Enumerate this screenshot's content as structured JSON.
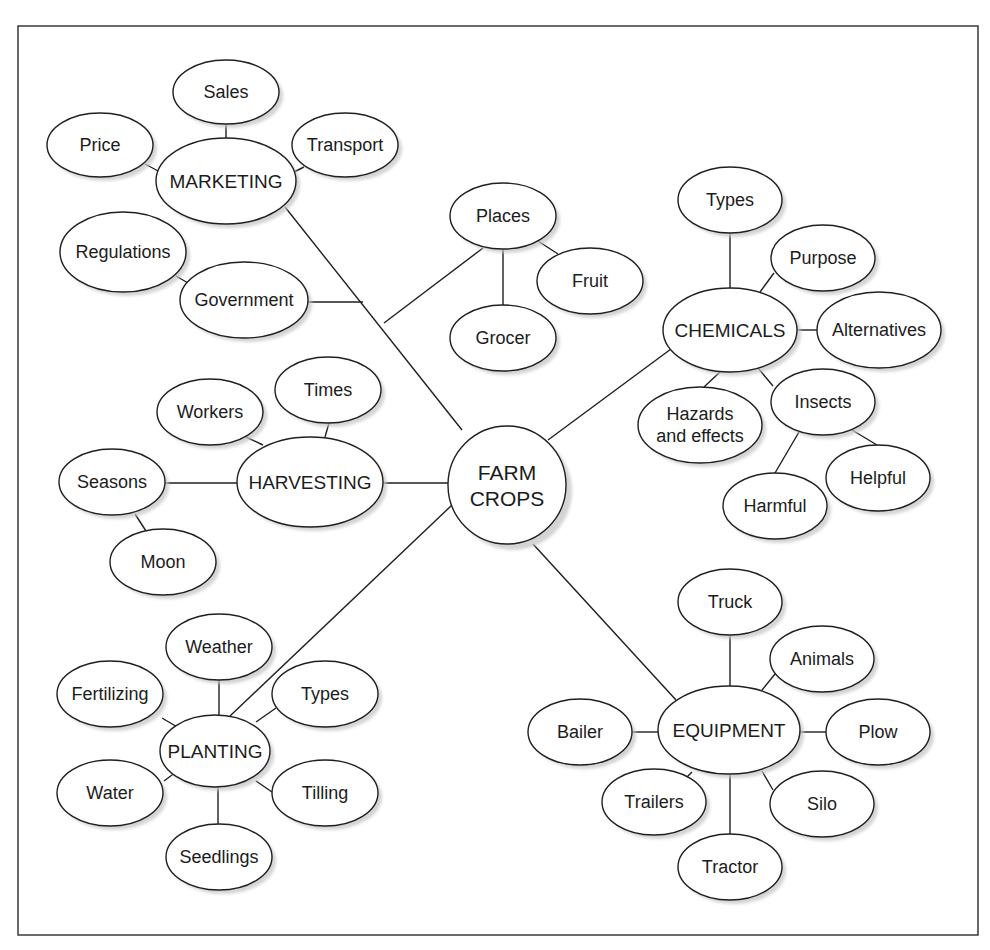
{
  "diagram": {
    "type": "concept-map",
    "root": {
      "id": "farm-crops",
      "lines": [
        "FARM",
        "CROPS"
      ],
      "cx": 507,
      "cy": 485,
      "r": 59
    },
    "frame": {
      "x": 18,
      "y": 26,
      "w": 960,
      "h": 909
    },
    "nodes": [
      {
        "id": "marketing",
        "kind": "hub",
        "lines": [
          "MARKETING"
        ],
        "cx": 226,
        "cy": 181,
        "rx": 70,
        "ry": 43
      },
      {
        "id": "sales",
        "kind": "leaf",
        "lines": [
          "Sales"
        ],
        "cx": 226,
        "cy": 92,
        "rx": 53,
        "ry": 32
      },
      {
        "id": "price",
        "kind": "leaf",
        "lines": [
          "Price"
        ],
        "cx": 100,
        "cy": 145,
        "rx": 53,
        "ry": 32
      },
      {
        "id": "transport",
        "kind": "leaf",
        "lines": [
          "Transport"
        ],
        "cx": 345,
        "cy": 145,
        "rx": 53,
        "ry": 32
      },
      {
        "id": "regulations",
        "kind": "leaf",
        "lines": [
          "Regulations"
        ],
        "cx": 123,
        "cy": 252,
        "rx": 63,
        "ry": 40
      },
      {
        "id": "government",
        "kind": "leaf",
        "lines": [
          "Government"
        ],
        "cx": 244,
        "cy": 300,
        "rx": 64,
        "ry": 38
      },
      {
        "id": "places",
        "kind": "leaf",
        "lines": [
          "Places"
        ],
        "cx": 503,
        "cy": 216,
        "rx": 53,
        "ry": 33
      },
      {
        "id": "fruit",
        "kind": "leaf",
        "lines": [
          "Fruit"
        ],
        "cx": 590,
        "cy": 281,
        "rx": 53,
        "ry": 33
      },
      {
        "id": "grocer",
        "kind": "leaf",
        "lines": [
          "Grocer"
        ],
        "cx": 503,
        "cy": 338,
        "rx": 53,
        "ry": 33
      },
      {
        "id": "chemicals",
        "kind": "hub",
        "lines": [
          "CHEMICALS"
        ],
        "cx": 730,
        "cy": 330,
        "rx": 67,
        "ry": 42
      },
      {
        "id": "chem-types",
        "kind": "leaf",
        "lines": [
          "Types"
        ],
        "cx": 730,
        "cy": 200,
        "rx": 52,
        "ry": 33
      },
      {
        "id": "purpose",
        "kind": "leaf",
        "lines": [
          "Purpose"
        ],
        "cx": 823,
        "cy": 258,
        "rx": 52,
        "ry": 33
      },
      {
        "id": "alternatives",
        "kind": "leaf",
        "lines": [
          "Alternatives"
        ],
        "cx": 879,
        "cy": 330,
        "rx": 62,
        "ry": 38
      },
      {
        "id": "hazards",
        "kind": "leaf",
        "lines": [
          "Hazards",
          "and effects"
        ],
        "cx": 700,
        "cy": 425,
        "rx": 62,
        "ry": 38
      },
      {
        "id": "insects",
        "kind": "leaf",
        "lines": [
          "Insects"
        ],
        "cx": 823,
        "cy": 402,
        "rx": 52,
        "ry": 33
      },
      {
        "id": "helpful",
        "kind": "leaf",
        "lines": [
          "Helpful"
        ],
        "cx": 878,
        "cy": 478,
        "rx": 52,
        "ry": 33
      },
      {
        "id": "harmful",
        "kind": "leaf",
        "lines": [
          "Harmful"
        ],
        "cx": 775,
        "cy": 506,
        "rx": 52,
        "ry": 33
      },
      {
        "id": "harvesting",
        "kind": "hub",
        "lines": [
          "HARVESTING"
        ],
        "cx": 310,
        "cy": 482,
        "rx": 73,
        "ry": 45
      },
      {
        "id": "workers",
        "kind": "leaf",
        "lines": [
          "Workers"
        ],
        "cx": 210,
        "cy": 412,
        "rx": 53,
        "ry": 33
      },
      {
        "id": "times",
        "kind": "leaf",
        "lines": [
          "Times"
        ],
        "cx": 328,
        "cy": 390,
        "rx": 53,
        "ry": 33
      },
      {
        "id": "seasons",
        "kind": "leaf",
        "lines": [
          "Seasons"
        ],
        "cx": 112,
        "cy": 482,
        "rx": 53,
        "ry": 33
      },
      {
        "id": "moon",
        "kind": "leaf",
        "lines": [
          "Moon"
        ],
        "cx": 163,
        "cy": 562,
        "rx": 53,
        "ry": 33
      },
      {
        "id": "planting",
        "kind": "hub",
        "lines": [
          "PLANTING"
        ],
        "cx": 215,
        "cy": 751,
        "rx": 55,
        "ry": 36
      },
      {
        "id": "weather",
        "kind": "leaf",
        "lines": [
          "Weather"
        ],
        "cx": 219,
        "cy": 647,
        "rx": 53,
        "ry": 33
      },
      {
        "id": "fertilizing",
        "kind": "leaf",
        "lines": [
          "Fertilizing"
        ],
        "cx": 110,
        "cy": 694,
        "rx": 53,
        "ry": 33
      },
      {
        "id": "plant-types",
        "kind": "leaf",
        "lines": [
          "Types"
        ],
        "cx": 325,
        "cy": 694,
        "rx": 53,
        "ry": 33
      },
      {
        "id": "water",
        "kind": "leaf",
        "lines": [
          "Water"
        ],
        "cx": 110,
        "cy": 793,
        "rx": 53,
        "ry": 33
      },
      {
        "id": "tilling",
        "kind": "leaf",
        "lines": [
          "Tilling"
        ],
        "cx": 325,
        "cy": 793,
        "rx": 53,
        "ry": 33
      },
      {
        "id": "seedlings",
        "kind": "leaf",
        "lines": [
          "Seedlings"
        ],
        "cx": 219,
        "cy": 857,
        "rx": 53,
        "ry": 33
      },
      {
        "id": "equipment",
        "kind": "hub",
        "lines": [
          "EQUIPMENT"
        ],
        "cx": 729,
        "cy": 730,
        "rx": 71,
        "ry": 44
      },
      {
        "id": "truck",
        "kind": "leaf",
        "lines": [
          "Truck"
        ],
        "cx": 730,
        "cy": 602,
        "rx": 52,
        "ry": 33
      },
      {
        "id": "animals",
        "kind": "leaf",
        "lines": [
          "Animals"
        ],
        "cx": 822,
        "cy": 659,
        "rx": 52,
        "ry": 33
      },
      {
        "id": "bailer",
        "kind": "leaf",
        "lines": [
          "Bailer"
        ],
        "cx": 580,
        "cy": 732,
        "rx": 52,
        "ry": 33
      },
      {
        "id": "plow",
        "kind": "leaf",
        "lines": [
          "Plow"
        ],
        "cx": 878,
        "cy": 732,
        "rx": 52,
        "ry": 33
      },
      {
        "id": "trailers",
        "kind": "leaf",
        "lines": [
          "Trailers"
        ],
        "cx": 654,
        "cy": 802,
        "rx": 52,
        "ry": 33
      },
      {
        "id": "silo",
        "kind": "leaf",
        "lines": [
          "Silo"
        ],
        "cx": 822,
        "cy": 804,
        "rx": 52,
        "ry": 33
      },
      {
        "id": "tractor",
        "kind": "leaf",
        "lines": [
          "Tractor"
        ],
        "cx": 730,
        "cy": 867,
        "rx": 52,
        "ry": 33
      }
    ],
    "edges": [
      {
        "from": "farm-crops",
        "to": "marketing",
        "pts": [
          [
            285,
            207
          ],
          [
            462,
            430
          ]
        ]
      },
      {
        "from": "government",
        "to": "marketing-branch",
        "pts": [
          [
            308,
            302
          ],
          [
            363,
            302
          ]
        ]
      },
      {
        "from": "places",
        "to": "marketing-branch",
        "pts": [
          [
            483,
            248
          ],
          [
            384,
            323
          ]
        ]
      },
      {
        "from": "places",
        "to": "grocer",
        "pts": [
          [
            503,
            249
          ],
          [
            503,
            305
          ]
        ]
      },
      {
        "from": "places",
        "to": "fruit",
        "pts": [
          [
            538,
            241
          ],
          [
            558,
            254
          ]
        ]
      },
      {
        "from": "marketing",
        "to": "sales",
        "pts": [
          [
            226,
            124
          ],
          [
            226,
            138
          ]
        ]
      },
      {
        "from": "marketing",
        "to": "price",
        "pts": [
          [
            145,
            164
          ],
          [
            160,
            172
          ]
        ]
      },
      {
        "from": "marketing",
        "to": "transport",
        "pts": [
          [
            294,
            172
          ],
          [
            304,
            167
          ]
        ]
      },
      {
        "from": "government",
        "to": "regulations",
        "pts": [
          [
            176,
            276
          ],
          [
            188,
            283
          ]
        ]
      },
      {
        "from": "farm-crops",
        "to": "chemicals",
        "pts": [
          [
            548,
            440
          ],
          [
            671,
            349
          ]
        ]
      },
      {
        "from": "chemicals",
        "to": "chem-types",
        "pts": [
          [
            730,
            233
          ],
          [
            730,
            288
          ]
        ]
      },
      {
        "from": "chemicals",
        "to": "purpose",
        "pts": [
          [
            760,
            292
          ],
          [
            774,
            273
          ]
        ]
      },
      {
        "from": "chemicals",
        "to": "alternatives",
        "pts": [
          [
            797,
            330
          ],
          [
            817,
            330
          ]
        ]
      },
      {
        "from": "chemicals",
        "to": "hazards",
        "pts": [
          [
            720,
            372
          ],
          [
            704,
            387
          ]
        ]
      },
      {
        "from": "chemicals",
        "to": "insects",
        "pts": [
          [
            758,
            368
          ],
          [
            773,
            386
          ]
        ]
      },
      {
        "from": "insects",
        "to": "harmful",
        "pts": [
          [
            799,
            432
          ],
          [
            775,
            473
          ]
        ]
      },
      {
        "from": "insects",
        "to": "helpful",
        "pts": [
          [
            852,
            430
          ],
          [
            877,
            445
          ]
        ]
      },
      {
        "from": "farm-crops",
        "to": "harvesting",
        "pts": [
          [
            383,
            483
          ],
          [
            448,
            483
          ]
        ]
      },
      {
        "from": "harvesting",
        "to": "seasons",
        "pts": [
          [
            165,
            483
          ],
          [
            237,
            483
          ]
        ]
      },
      {
        "from": "harvesting",
        "to": "workers",
        "pts": [
          [
            246,
            437
          ],
          [
            263,
            445
          ]
        ]
      },
      {
        "from": "harvesting",
        "to": "times",
        "pts": [
          [
            329,
            423
          ],
          [
            325,
            437
          ]
        ]
      },
      {
        "from": "seasons",
        "to": "moon",
        "pts": [
          [
            135,
            514
          ],
          [
            146,
            531
          ]
        ]
      },
      {
        "from": "farm-crops",
        "to": "planting",
        "pts": [
          [
            452,
            505
          ],
          [
            230,
            716
          ]
        ]
      },
      {
        "from": "planting",
        "to": "weather",
        "pts": [
          [
            219,
            680
          ],
          [
            219,
            715
          ]
        ]
      },
      {
        "from": "planting",
        "to": "fertilizing",
        "pts": [
          [
            162,
            718
          ],
          [
            184,
            731
          ]
        ]
      },
      {
        "from": "planting",
        "to": "plant-types",
        "pts": [
          [
            256,
            722
          ],
          [
            276,
            708
          ]
        ]
      },
      {
        "from": "planting",
        "to": "water",
        "pts": [
          [
            164,
            781
          ],
          [
            180,
            769
          ]
        ]
      },
      {
        "from": "planting",
        "to": "tilling",
        "pts": [
          [
            256,
            781
          ],
          [
            272,
            792
          ]
        ]
      },
      {
        "from": "planting",
        "to": "seedlings",
        "pts": [
          [
            218,
            787
          ],
          [
            218,
            825
          ]
        ]
      },
      {
        "from": "farm-crops",
        "to": "equipment",
        "pts": [
          [
            533,
            544
          ],
          [
            676,
            700
          ]
        ]
      },
      {
        "from": "equipment",
        "to": "truck",
        "pts": [
          [
            730,
            635
          ],
          [
            730,
            686
          ]
        ]
      },
      {
        "from": "equipment",
        "to": "animals",
        "pts": [
          [
            762,
            690
          ],
          [
            775,
            674
          ]
        ]
      },
      {
        "from": "equipment",
        "to": "bailer",
        "pts": [
          [
            632,
            732
          ],
          [
            658,
            732
          ]
        ]
      },
      {
        "from": "equipment",
        "to": "plow",
        "pts": [
          [
            800,
            732
          ],
          [
            826,
            732
          ]
        ]
      },
      {
        "from": "equipment",
        "to": "trailers",
        "pts": [
          [
            692,
            772
          ],
          [
            682,
            782
          ]
        ]
      },
      {
        "from": "equipment",
        "to": "silo",
        "pts": [
          [
            762,
            771
          ],
          [
            773,
            790
          ]
        ]
      },
      {
        "from": "equipment",
        "to": "tractor",
        "pts": [
          [
            730,
            775
          ],
          [
            730,
            835
          ]
        ]
      }
    ]
  }
}
